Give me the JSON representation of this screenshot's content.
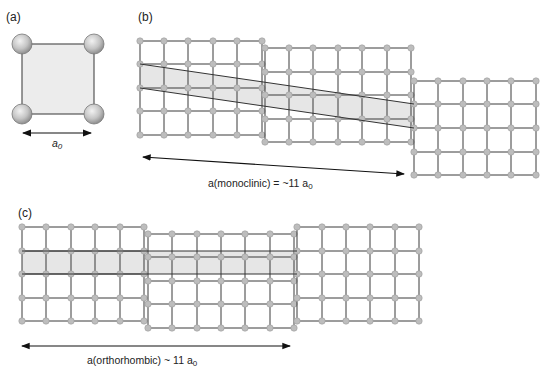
{
  "panels": {
    "a": {
      "label": "(a)",
      "dimension_label": "a",
      "dimension_sub": "0"
    },
    "b": {
      "label": "(b)",
      "caption_main": "a(monoclinic)  = ~11 a",
      "caption_sub": "0"
    },
    "c": {
      "label": "(c)",
      "caption_main": "a(orthorhombic)  ~ 11 a",
      "caption_sub": "0"
    }
  },
  "colors": {
    "line": "#3a3a3a",
    "node": "#bdbdbd",
    "node_stroke": "#9a9a9a",
    "shade": "#e9e9e9"
  },
  "grids": {
    "b": [
      {
        "xs": [
          140,
          164,
          188,
          213,
          237,
          262
        ],
        "ys": [
          41,
          64,
          88,
          111,
          135
        ]
      },
      {
        "xs": [
          265,
          289,
          313,
          338,
          362,
          387,
          411
        ],
        "ys": [
          48,
          72,
          95,
          119,
          142
        ]
      },
      {
        "xs": [
          414,
          438,
          463,
          487,
          511,
          536
        ],
        "ys": [
          81,
          104,
          128,
          152,
          175
        ]
      }
    ],
    "c": [
      {
        "xs": [
          22,
          46,
          71,
          95,
          120,
          144
        ],
        "ys": [
          227,
          251,
          274,
          298,
          321
        ]
      },
      {
        "xs": [
          148,
          172,
          197,
          221,
          245,
          270,
          294
        ],
        "ys": [
          234,
          257,
          281,
          304,
          328
        ]
      },
      {
        "xs": [
          297,
          322,
          346,
          370,
          395,
          419
        ],
        "ys": [
          227,
          251,
          274,
          298,
          321
        ]
      }
    ]
  }
}
